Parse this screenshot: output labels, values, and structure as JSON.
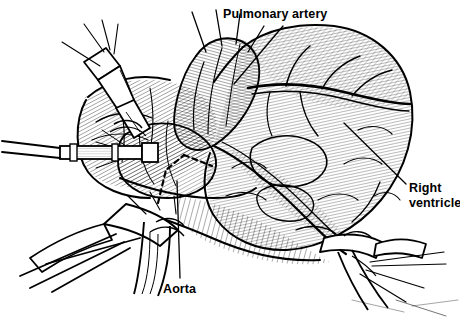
{
  "figure": {
    "kind": "medical-illustration",
    "title_visible": false,
    "background_color": "#ffffff",
    "ink_color": "#000000",
    "width": 460,
    "height": 334
  },
  "labels": [
    {
      "id": "pulmonary-artery",
      "text": "Pulmonary artery",
      "lines": [
        "Pulmonary artery"
      ],
      "align": "left",
      "x": 223,
      "y": 7,
      "leader": {
        "from": [
          283,
          26
        ],
        "to": [
          234,
          84
        ]
      }
    },
    {
      "id": "right-ventricle",
      "text": "Right ventricle",
      "lines": [
        "Right",
        "ventricle"
      ],
      "align": "left",
      "x": 409,
      "y": 181,
      "leader": {
        "from": [
          405,
          184
        ],
        "to": [
          345,
          124
        ]
      }
    },
    {
      "id": "aorta",
      "text": "Aorta",
      "lines": [
        "Aorta"
      ],
      "align": "left",
      "x": 163,
      "y": 282,
      "leader": {
        "from": [
          180,
          278
        ],
        "to": [
          177,
          181
        ]
      }
    }
  ],
  "annotations": {
    "dashed_incision": {
      "name": "dashed-incision-line",
      "description": "Dashed inverted-V incision marking on the aortic root",
      "style": "dashed",
      "dash_pattern": "5 4"
    }
  },
  "instruments": [
    {
      "name": "aortic-cannula-upper-left",
      "position": "upper-left"
    },
    {
      "name": "aortic-root-cannula",
      "position": "center-left"
    },
    {
      "name": "venous-cannula-lower-left",
      "position": "lower-left"
    },
    {
      "name": "venous-cannula-lower-right",
      "position": "lower-right"
    },
    {
      "name": "suture-threads",
      "position": "multiple"
    }
  ],
  "anatomy": [
    {
      "name": "aorta"
    },
    {
      "name": "pulmonary-artery"
    },
    {
      "name": "right-ventricle"
    },
    {
      "name": "right-atrium"
    },
    {
      "name": "coronary-artery"
    },
    {
      "name": "epicardial-fat"
    }
  ]
}
